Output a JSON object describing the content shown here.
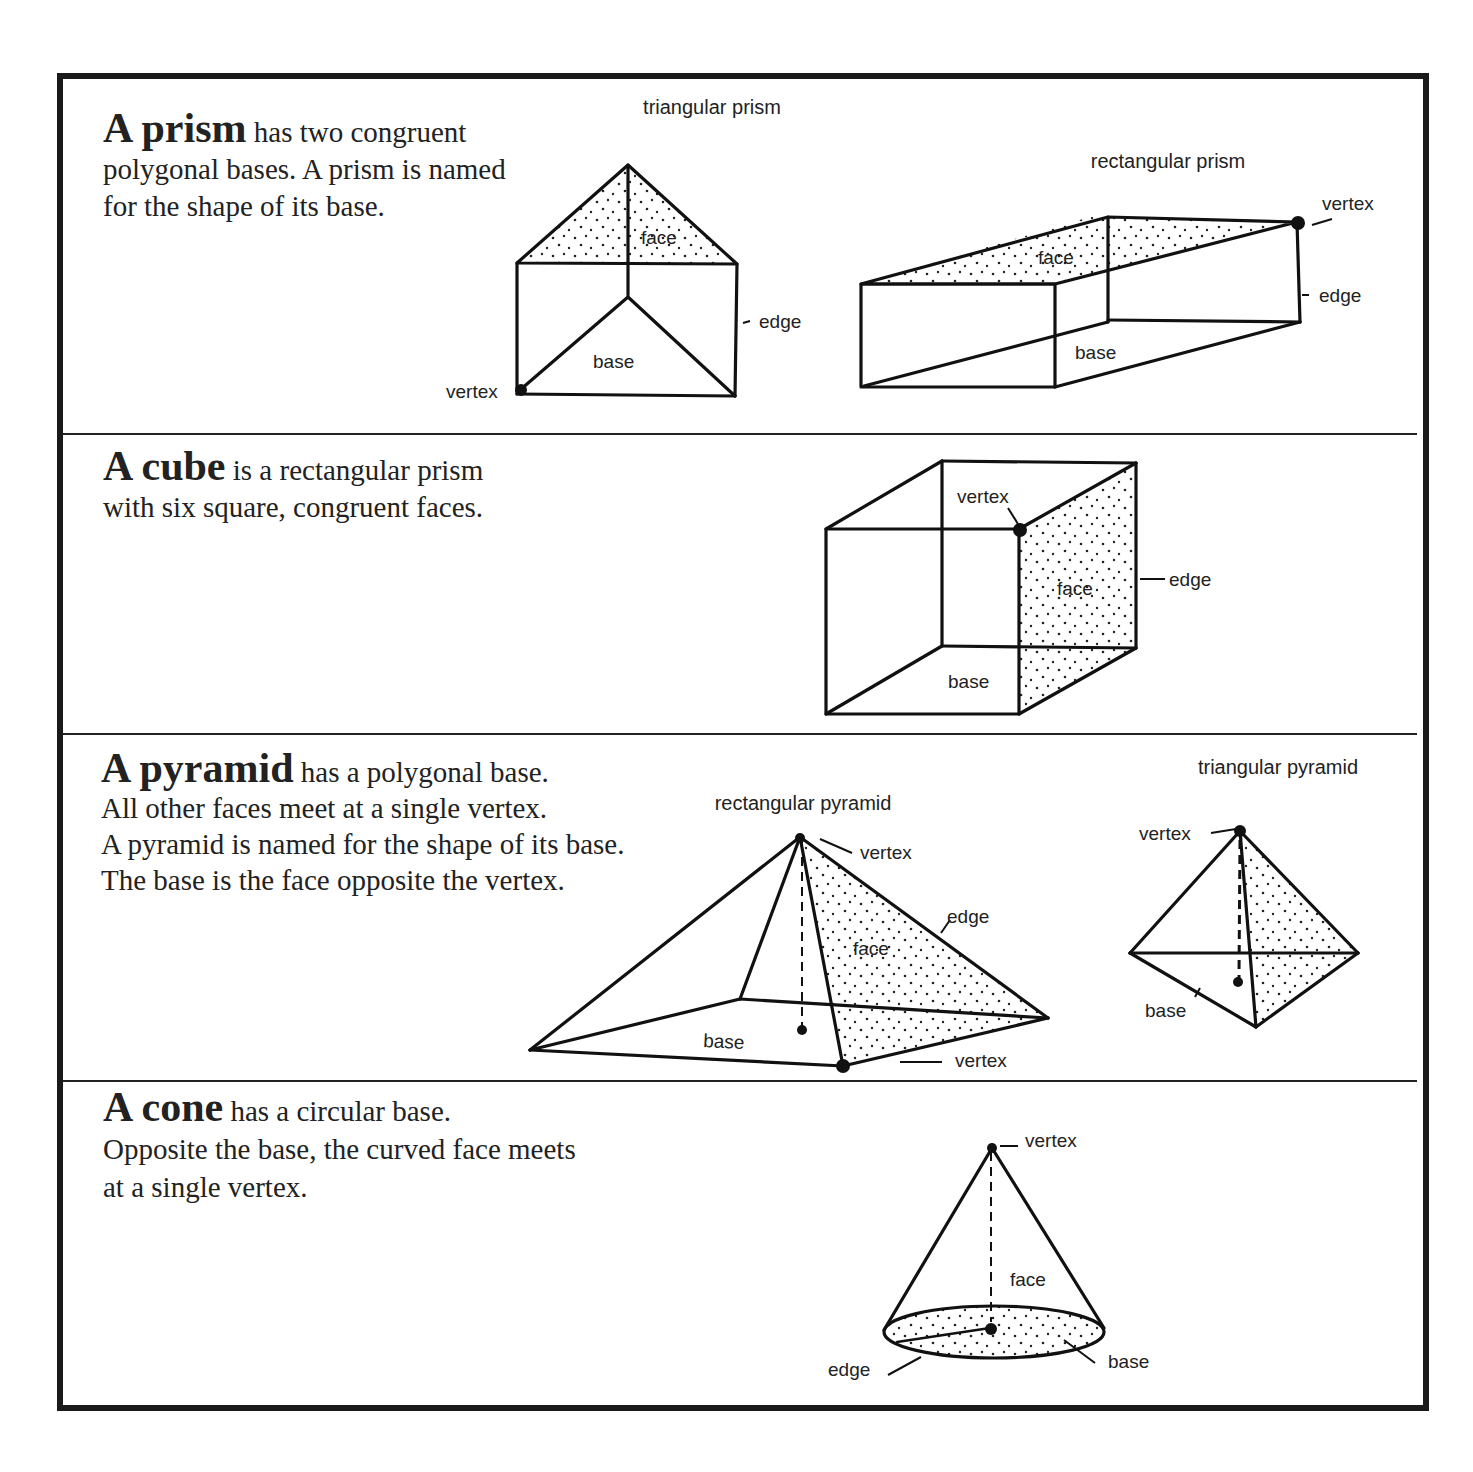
{
  "sections": [
    {
      "id": "prism",
      "term": "A prism",
      "lines": [
        "has two congruent",
        "polygonal bases. A prism is named",
        "for the shape of its base."
      ],
      "figures": [
        {
          "caption": "triangular prism",
          "labels": {
            "face": "face",
            "edge": "edge",
            "base": "base",
            "vertex": "vertex"
          }
        },
        {
          "caption": "rectangular prism",
          "labels": {
            "face": "face",
            "edge": "edge",
            "base": "base",
            "vertex": "vertex"
          }
        }
      ]
    },
    {
      "id": "cube",
      "term": "A cube",
      "lines": [
        "is a rectangular prism",
        "with six square, congruent faces."
      ],
      "figures": [
        {
          "caption": "",
          "labels": {
            "vertex": "vertex",
            "face": "face",
            "edge": "edge",
            "base": "base"
          }
        }
      ]
    },
    {
      "id": "pyramid",
      "term": "A pyramid",
      "lines": [
        "has a polygonal base.",
        "All other faces meet at a single vertex.",
        "A pyramid is named for the shape of its base.",
        "The base is the face opposite the vertex."
      ],
      "figures": [
        {
          "caption": "rectangular pyramid",
          "labels": {
            "vertex_top": "vertex",
            "edge": "edge",
            "face": "face",
            "base": "base",
            "vertex_bottom": "vertex"
          }
        },
        {
          "caption": "triangular pyramid",
          "labels": {
            "vertex": "vertex",
            "base": "base"
          }
        }
      ]
    },
    {
      "id": "cone",
      "term": "A cone",
      "lines": [
        "has a circular base.",
        "Opposite the base, the curved face meets",
        "at a single vertex."
      ],
      "figures": [
        {
          "caption": "",
          "labels": {
            "vertex": "vertex",
            "face": "face",
            "edge": "edge",
            "base": "base"
          }
        }
      ]
    }
  ]
}
